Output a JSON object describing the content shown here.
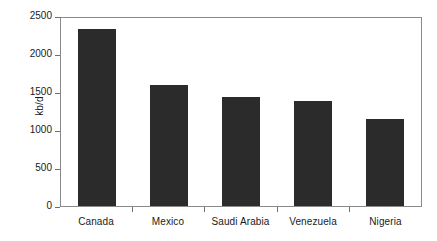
{
  "chart_data": {
    "type": "bar",
    "title": "",
    "xlabel": "",
    "ylabel": "kb/d",
    "categories": [
      "Canada",
      "Mexico",
      "Saudi Arabia",
      "Venezuela",
      "Nigeria"
    ],
    "values": [
      2350,
      1610,
      1450,
      1400,
      1160
    ],
    "ylim": [
      0,
      2500
    ],
    "yticks": [
      0,
      500,
      1000,
      1500,
      2000,
      2500
    ],
    "ytick_labels": [
      "0",
      "500",
      "1000",
      "1500",
      "2000",
      "2500"
    ],
    "grid": false,
    "legend": null,
    "bar_color": "#2b2b2b",
    "frame_color": "#8a8a8a",
    "text_color": "#1a1a1a"
  }
}
